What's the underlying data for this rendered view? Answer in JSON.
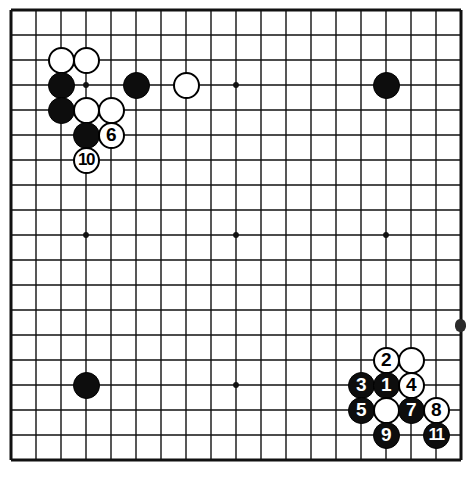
{
  "figure": {
    "kind": "go-board-diagram",
    "board_size": 19,
    "geometry": {
      "origin_x": 11,
      "origin_y": 10,
      "spacing": 25,
      "stone_diameter": 27,
      "line_color": "#111111",
      "board_color": "#ffffff",
      "border_width": 3,
      "line_width": 1.4
    },
    "star_points": [
      {
        "col": 3,
        "row": 3
      },
      {
        "col": 9,
        "row": 3
      },
      {
        "col": 15,
        "row": 3
      },
      {
        "col": 3,
        "row": 9
      },
      {
        "col": 9,
        "row": 9
      },
      {
        "col": 15,
        "row": 9
      },
      {
        "col": 3,
        "row": 15
      },
      {
        "col": 9,
        "row": 15
      },
      {
        "col": 15,
        "row": 15
      }
    ],
    "edge_mark": {
      "x": 455,
      "y": 319
    },
    "stones": [
      {
        "col": 2,
        "row": 2,
        "color": "white",
        "label": ""
      },
      {
        "col": 3,
        "row": 2,
        "color": "white",
        "label": ""
      },
      {
        "col": 2,
        "row": 3,
        "color": "black",
        "label": ""
      },
      {
        "col": 5,
        "row": 3,
        "color": "black",
        "label": ""
      },
      {
        "col": 7,
        "row": 3,
        "color": "white",
        "label": ""
      },
      {
        "col": 15,
        "row": 3,
        "color": "black",
        "label": ""
      },
      {
        "col": 2,
        "row": 4,
        "color": "black",
        "label": ""
      },
      {
        "col": 3,
        "row": 4,
        "color": "white",
        "label": ""
      },
      {
        "col": 4,
        "row": 4,
        "color": "white",
        "label": ""
      },
      {
        "col": 3,
        "row": 5,
        "color": "black",
        "label": ""
      },
      {
        "col": 4,
        "row": 5,
        "color": "white",
        "label": "6"
      },
      {
        "col": 3,
        "row": 6,
        "color": "white",
        "label": "10"
      },
      {
        "col": 3,
        "row": 15,
        "color": "black",
        "label": ""
      },
      {
        "col": 15,
        "row": 14,
        "color": "white",
        "label": "2"
      },
      {
        "col": 16,
        "row": 14,
        "color": "white",
        "label": ""
      },
      {
        "col": 14,
        "row": 15,
        "color": "black",
        "label": "3"
      },
      {
        "col": 15,
        "row": 15,
        "color": "black",
        "label": "1"
      },
      {
        "col": 16,
        "row": 15,
        "color": "white",
        "label": "4"
      },
      {
        "col": 14,
        "row": 16,
        "color": "black",
        "label": "5"
      },
      {
        "col": 15,
        "row": 16,
        "color": "white",
        "label": ""
      },
      {
        "col": 16,
        "row": 16,
        "color": "black",
        "label": "7"
      },
      {
        "col": 17,
        "row": 16,
        "color": "white",
        "label": "8"
      },
      {
        "col": 15,
        "row": 17,
        "color": "black",
        "label": "9"
      },
      {
        "col": 17,
        "row": 17,
        "color": "black",
        "label": "11"
      }
    ]
  }
}
